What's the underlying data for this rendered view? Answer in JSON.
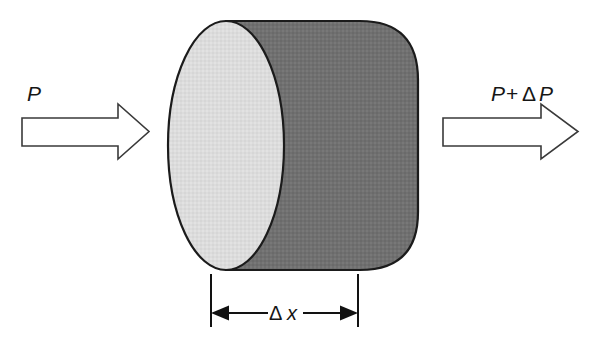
{
  "figure": {
    "background_color": "#ffffff",
    "width": 589,
    "height": 342
  },
  "labels": {
    "inlet_pressure": "P",
    "outlet_pressure_p": "P",
    "outlet_pressure_plus": "+",
    "outlet_pressure_delta": "Δ",
    "outlet_pressure_p2": "P",
    "outlet_pressure_full": "P + ΔP",
    "thickness_delta": "Δ",
    "thickness_x": "x",
    "thickness_full": "Δx"
  },
  "colors": {
    "cylinder_side_fill": "#707070",
    "cylinder_face_fill": "#dcdcdc",
    "outline_stroke": "#1b1b1b",
    "arrow_stroke": "#3a3a3a",
    "arrow_fill": "#ffffff",
    "dimension_stroke": "#121212",
    "text_color": "#161616"
  },
  "geometry": {
    "cylinder": {
      "face_center_x": 226,
      "face_center_y": 146,
      "face_radius_x": 58,
      "face_radius_y": 125,
      "body_right_x": 418,
      "top_y": 22,
      "bottom_y": 270
    },
    "inlet_arrow": {
      "shaft_left_x": 22,
      "shaft_right_x": 118,
      "tip_x": 149,
      "shaft_top_y": 118,
      "shaft_bottom_y": 146,
      "head_top_y": 104,
      "head_bottom_y": 159
    },
    "outlet_arrow": {
      "shaft_left_x": 443,
      "shaft_right_x": 541,
      "tip_x": 578,
      "shaft_top_y": 118,
      "shaft_bottom_y": 146,
      "head_top_y": 104,
      "head_bottom_y": 159
    },
    "dimension": {
      "left_x": 211,
      "right_x": 358,
      "line_y": 313,
      "ext_top_y": 274,
      "ext_bottom_y": 327,
      "label_center_x": 285
    }
  },
  "elements": [
    {
      "name": "inlet-pressure-label",
      "text": "P"
    },
    {
      "name": "inlet-arrow",
      "text": ""
    },
    {
      "name": "cylinder",
      "text": ""
    },
    {
      "name": "outlet-arrow",
      "text": ""
    },
    {
      "name": "outlet-pressure-label",
      "text": "P + ΔP"
    },
    {
      "name": "thickness-dimension",
      "text": "Δx"
    }
  ]
}
